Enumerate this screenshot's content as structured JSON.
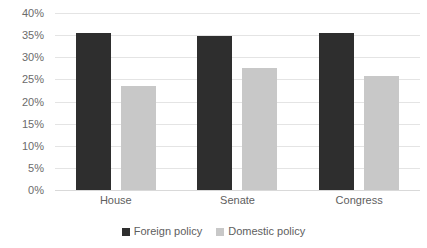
{
  "chart_data": {
    "type": "bar",
    "title": "",
    "subtitle": "",
    "xlabel": "",
    "ylabel": "",
    "categories": [
      "House",
      "Senate",
      "Congress"
    ],
    "series": [
      {
        "name": "Foreign policy",
        "color": "#2e2e2e",
        "values": [
          35.5,
          34.8,
          35.4
        ]
      },
      {
        "name": "Domestic policy",
        "color": "#c8c8c8",
        "values": [
          23.5,
          27.5,
          25.7
        ]
      }
    ],
    "ylim": [
      0,
      40
    ],
    "ytick_step": 5,
    "ytick_labels": [
      "0%",
      "5%",
      "10%",
      "15%",
      "20%",
      "25%",
      "30%",
      "35%",
      "40%"
    ],
    "ytick_values": [
      0,
      5,
      10,
      15,
      20,
      25,
      30,
      35,
      40
    ],
    "grid": true,
    "grid_axis": "y",
    "grid_color": "#e4e4e4",
    "legend_position": "bottom",
    "legend_marker": "square",
    "background": "#ffffff",
    "value_suffix": "%"
  }
}
